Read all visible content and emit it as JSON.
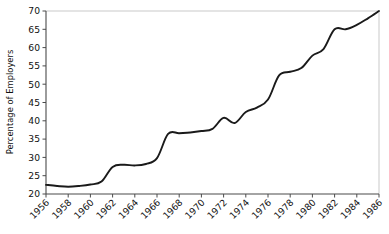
{
  "chart_data": {
    "type": "line",
    "title": "",
    "xlabel": "",
    "ylabel": "Percentage of Employers",
    "xlim": [
      1956,
      1986
    ],
    "ylim": [
      20,
      70
    ],
    "yticks": [
      20,
      25,
      30,
      35,
      40,
      45,
      50,
      55,
      60,
      65,
      70
    ],
    "ytick_labels": [
      "20",
      "25",
      "30",
      "35",
      "40",
      "45",
      "50",
      "55",
      "60",
      "65",
      "70"
    ],
    "xticks": [
      1956,
      1958,
      1960,
      1962,
      1964,
      1966,
      1968,
      1970,
      1972,
      1974,
      1976,
      1978,
      1980,
      1982,
      1984,
      1986
    ],
    "xtick_labels": [
      "1956",
      "1958",
      "1960",
      "1962",
      "1964",
      "1966",
      "1968",
      "1970",
      "1972",
      "1974",
      "1976",
      "1978",
      "1980",
      "1982",
      "1984",
      "1986"
    ],
    "xtick_rotation": 45,
    "grid": false,
    "legend": false,
    "legend_position": "none",
    "line_color": "#1a1a1a",
    "axis_color": "#4a4a4a",
    "frame_color": "#c9c9c9",
    "background_color": "#ffffff",
    "series": [
      {
        "name": "Percentage of Employers",
        "x": [
          1956,
          1957,
          1958,
          1959,
          1960,
          1961,
          1962,
          1963,
          1964,
          1965,
          1966,
          1967,
          1968,
          1969,
          1970,
          1971,
          1972,
          1973,
          1974,
          1975,
          1976,
          1977,
          1978,
          1979,
          1980,
          1981,
          1982,
          1983,
          1984,
          1985,
          1986
        ],
        "values": [
          22.5,
          22.2,
          22.0,
          22.2,
          22.6,
          23.4,
          27.4,
          28.0,
          27.8,
          28.2,
          29.8,
          36.4,
          36.6,
          36.8,
          37.2,
          37.8,
          40.8,
          39.4,
          42.4,
          43.6,
          45.8,
          52.4,
          53.4,
          54.4,
          57.8,
          59.6,
          65.0,
          65.0,
          66.2,
          68.0,
          70.0
        ]
      }
    ]
  }
}
